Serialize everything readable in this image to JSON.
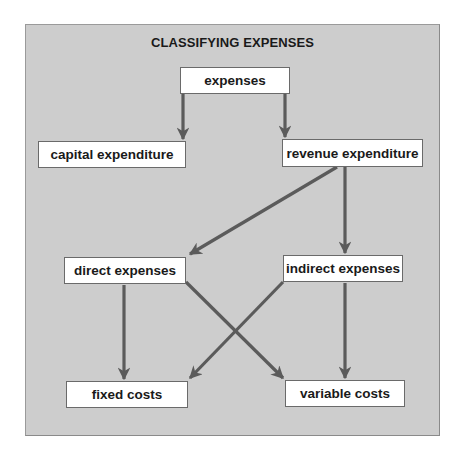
{
  "diagram": {
    "title": "CLASSIFYING EXPENSES",
    "colors": {
      "background": "#cdcdcd",
      "node_fill": "#ffffff",
      "arrow": "#5b5b5b",
      "text": "#1a1a1a"
    },
    "nodes": {
      "expenses": "expenses",
      "capital_expenditure": "capital expenditure",
      "revenue_expenditure": "revenue expenditure",
      "direct_expenses": "direct expenses",
      "indirect_expenses": "indirect expenses",
      "fixed_costs": "fixed costs",
      "variable_costs": "variable costs"
    },
    "edges": [
      {
        "from": "expenses",
        "to": "capital_expenditure"
      },
      {
        "from": "expenses",
        "to": "revenue_expenditure"
      },
      {
        "from": "revenue_expenditure",
        "to": "direct_expenses"
      },
      {
        "from": "revenue_expenditure",
        "to": "indirect_expenses"
      },
      {
        "from": "direct_expenses",
        "to": "fixed_costs"
      },
      {
        "from": "direct_expenses",
        "to": "variable_costs"
      },
      {
        "from": "indirect_expenses",
        "to": "fixed_costs"
      },
      {
        "from": "indirect_expenses",
        "to": "variable_costs"
      }
    ]
  }
}
